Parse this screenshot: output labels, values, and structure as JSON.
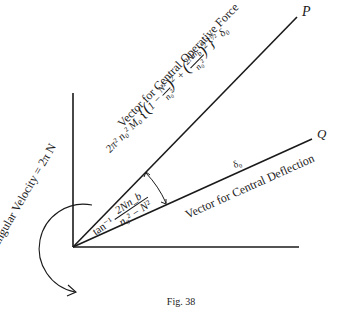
{
  "figure": {
    "caption": "Fig. 38",
    "vectors": {
      "force": {
        "end_label": "P",
        "name_label": "Vector for Central Operative Force",
        "magnitude_prefix": "2π² n₀² M₀",
        "magnitude_formula": "2π²n₀²M₀{(1 − N²/n₀²)² + (2Nn_b/n₀²)²}^½ δ₀"
      },
      "deflection": {
        "end_label": "Q",
        "name_label": "Vector for Central Deflection",
        "magnitude_label": "δ₀"
      }
    },
    "angle_label": {
      "prefix": "tan⁻¹",
      "numerator": "2Nn_b",
      "denominator": "n₀² − N²"
    },
    "rotation_label": "Angular Velocity = 2π N"
  }
}
